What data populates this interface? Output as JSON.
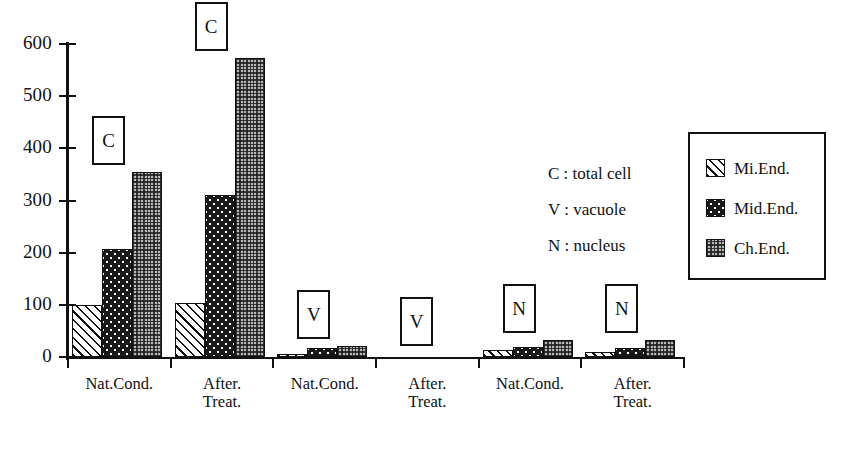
{
  "chart_data": {
    "type": "bar",
    "title": "",
    "xlabel": "",
    "ylabel": "",
    "ylim": [
      0,
      600
    ],
    "y_ticks": [
      0,
      100,
      200,
      300,
      400,
      500,
      600
    ],
    "grid": false,
    "legend_position": "right",
    "categories": [
      "Nat.Cond.",
      "After.\nTreat.",
      "Nat.Cond.",
      "After.\nTreat.",
      "Nat.Cond.",
      "After.\nTreat."
    ],
    "group_markers": [
      "C",
      "C",
      "V",
      "V",
      "N",
      "N"
    ],
    "series": [
      {
        "name": "Mi.End.",
        "values": [
          100,
          103,
          5,
          0,
          13,
          10
        ]
      },
      {
        "name": "Mid.End.",
        "values": [
          207,
          310,
          18,
          0,
          20,
          18
        ]
      },
      {
        "name": "Ch.End.",
        "values": [
          355,
          574,
          22,
          0,
          33,
          32
        ]
      }
    ],
    "annotations": [
      "C : total cell",
      "V : vacuole",
      "N : nucleus"
    ]
  },
  "axis": {
    "y_tick_labels": [
      "600",
      "500",
      "400",
      "300",
      "200",
      "100",
      "0"
    ]
  },
  "x_labels": [
    {
      "line1": "Nat.Cond.",
      "line2": ""
    },
    {
      "line1": "After.",
      "line2": "Treat."
    },
    {
      "line1": "Nat.Cond.",
      "line2": ""
    },
    {
      "line1": "After.",
      "line2": "Treat."
    },
    {
      "line1": "Nat.Cond.",
      "line2": ""
    },
    {
      "line1": "After.",
      "line2": "Treat."
    }
  ],
  "markers": [
    {
      "text": "C"
    },
    {
      "text": "C"
    },
    {
      "text": "V"
    },
    {
      "text": "V"
    },
    {
      "text": "N"
    },
    {
      "text": "N"
    }
  ],
  "annotations": {
    "line1": "C : total cell",
    "line2": "V : vacuole",
    "line3": "N : nucleus"
  },
  "legend": {
    "items": [
      {
        "label": "Mi.End.",
        "pattern": "diagonal-hatch"
      },
      {
        "label": "Mid.End.",
        "pattern": "black-polka-dot"
      },
      {
        "label": "Ch.End.",
        "pattern": "gray-checker"
      }
    ]
  },
  "colors": {
    "axis": "#111111",
    "mi_end_fill": "#ffffff",
    "mid_end_fill": "#1a1a1a",
    "ch_end_fill": "#b9b9b9"
  }
}
